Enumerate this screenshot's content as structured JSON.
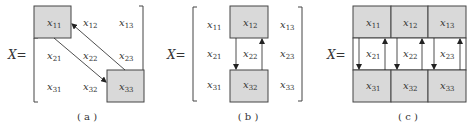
{
  "panels": [
    {
      "id": "a",
      "caption": "( a )",
      "matrix_label": "X=",
      "cells": [
        [
          "x",
          "11"
        ],
        [
          "x",
          "12"
        ],
        [
          "x",
          "13"
        ],
        [
          "x",
          "21"
        ],
        [
          "x",
          "22"
        ],
        [
          "x",
          "23"
        ],
        [
          "x",
          "31"
        ],
        [
          "x",
          "32"
        ],
        [
          "x",
          "33"
        ]
      ],
      "highlighted": [
        "x11",
        "x33"
      ],
      "arrows": [
        {
          "from": "x11",
          "to": "x33"
        },
        {
          "from": "x33",
          "to": "x11"
        }
      ]
    },
    {
      "id": "b",
      "caption": "( b )",
      "matrix_label": "X=",
      "highlighted": [
        "x12",
        "x32"
      ],
      "arrows": [
        {
          "from": "x12",
          "to": "x32"
        },
        {
          "from": "x32",
          "to": "x12"
        }
      ]
    },
    {
      "id": "c",
      "caption": "( c )",
      "matrix_label": "X=",
      "highlighted": [
        "x11",
        "x12",
        "x13",
        "x31",
        "x32",
        "x33"
      ],
      "arrows": [
        {
          "from": "x11",
          "to": "x31"
        },
        {
          "from": "x31",
          "to": "x11"
        },
        {
          "from": "x12",
          "to": "x32"
        },
        {
          "from": "x32",
          "to": "x12"
        },
        {
          "from": "x13",
          "to": "x33"
        },
        {
          "from": "x33",
          "to": "x13"
        }
      ]
    }
  ],
  "colors": {
    "box_fill": "#d9d9d9",
    "stroke": "#333333",
    "text": "#333333"
  },
  "text": {
    "x": "x",
    "eq": "X=",
    "s11": "11",
    "s12": "12",
    "s13": "13",
    "s21": "21",
    "s22": "22",
    "s23": "23",
    "s31": "31",
    "s32": "32",
    "s33": "33",
    "cap_a": "( a )",
    "cap_b": "( b )",
    "cap_c": "( c )"
  }
}
